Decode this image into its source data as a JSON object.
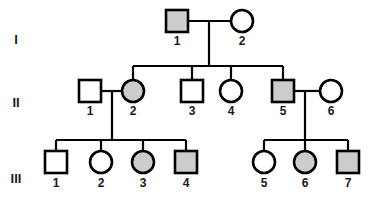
{
  "diagram": {
    "type": "pedigree-chart",
    "width": 381,
    "height": 201,
    "background_color": "#ffffff",
    "line_color": "#000000",
    "affected_fill": "#cccccc",
    "unaffected_fill": "#ffffff"
  },
  "generation_labels": [
    {
      "name": "generation-label-1",
      "text": "I",
      "x": 16,
      "y": 41
    },
    {
      "name": "generation-label-2",
      "text": "II",
      "x": 16,
      "y": 104
    },
    {
      "name": "generation-label-3",
      "text": "III",
      "x": 16,
      "y": 180
    }
  ],
  "individuals": [
    {
      "id": "I-1",
      "label": "1",
      "generation": "I",
      "sex": "male",
      "shape": "square",
      "affected": true,
      "cx": 177,
      "cy": 21,
      "label_x": 177,
      "label_y": 42
    },
    {
      "id": "I-2",
      "label": "2",
      "generation": "I",
      "sex": "female",
      "shape": "circle",
      "affected": false,
      "cx": 242,
      "cy": 21,
      "label_x": 242,
      "label_y": 42
    },
    {
      "id": "II-1",
      "label": "1",
      "generation": "II",
      "sex": "male",
      "shape": "square",
      "affected": false,
      "cx": 90,
      "cy": 91,
      "label_x": 90,
      "label_y": 112
    },
    {
      "id": "II-2",
      "label": "2",
      "generation": "II",
      "sex": "female",
      "shape": "circle",
      "affected": true,
      "cx": 133,
      "cy": 91,
      "label_x": 133,
      "label_y": 112
    },
    {
      "id": "II-3",
      "label": "3",
      "generation": "II",
      "sex": "male",
      "shape": "square",
      "affected": false,
      "cx": 192,
      "cy": 91,
      "label_x": 192,
      "label_y": 112
    },
    {
      "id": "II-4",
      "label": "4",
      "generation": "II",
      "sex": "female",
      "shape": "circle",
      "affected": false,
      "cx": 231,
      "cy": 91,
      "label_x": 231,
      "label_y": 112
    },
    {
      "id": "II-5",
      "label": "5",
      "generation": "II",
      "sex": "male",
      "shape": "square",
      "affected": true,
      "cx": 283,
      "cy": 91,
      "label_x": 283,
      "label_y": 112
    },
    {
      "id": "II-6",
      "label": "6",
      "generation": "II",
      "sex": "female",
      "shape": "circle",
      "affected": false,
      "cx": 331,
      "cy": 91,
      "label_x": 331,
      "label_y": 112
    },
    {
      "id": "III-1",
      "label": "1",
      "generation": "III",
      "sex": "male",
      "shape": "square",
      "affected": false,
      "cx": 56,
      "cy": 162,
      "label_x": 56,
      "label_y": 184
    },
    {
      "id": "III-2",
      "label": "2",
      "generation": "III",
      "sex": "female",
      "shape": "circle",
      "affected": false,
      "cx": 101,
      "cy": 162,
      "label_x": 101,
      "label_y": 184
    },
    {
      "id": "III-3",
      "label": "3",
      "generation": "III",
      "sex": "female",
      "shape": "circle",
      "affected": true,
      "cx": 143,
      "cy": 162,
      "label_x": 143,
      "label_y": 184
    },
    {
      "id": "III-4",
      "label": "4",
      "generation": "III",
      "sex": "male",
      "shape": "square",
      "affected": true,
      "cx": 186,
      "cy": 162,
      "label_x": 186,
      "label_y": 184
    },
    {
      "id": "III-5",
      "label": "5",
      "generation": "III",
      "sex": "female",
      "shape": "circle",
      "affected": false,
      "cx": 264,
      "cy": 162,
      "label_x": 264,
      "label_y": 184
    },
    {
      "id": "III-6",
      "label": "6",
      "generation": "III",
      "sex": "female",
      "shape": "circle",
      "affected": true,
      "cx": 305,
      "cy": 162,
      "label_x": 305,
      "label_y": 184
    },
    {
      "id": "III-7",
      "label": "7",
      "generation": "III",
      "sex": "male",
      "shape": "square",
      "affected": true,
      "cx": 348,
      "cy": 162,
      "label_x": 348,
      "label_y": 184
    }
  ],
  "symbol_size": {
    "square_side": 22,
    "circle_radius": 11
  },
  "connections": [
    {
      "name": "mating-line-I1-I2",
      "x1": 188,
      "y1": 21,
      "x2": 231,
      "y2": 21
    },
    {
      "name": "descent-line-I1-I2",
      "x1": 209,
      "y1": 21,
      "x2": 209,
      "y2": 66
    },
    {
      "name": "sibship-line-gen2",
      "x1": 133,
      "y1": 66,
      "x2": 283,
      "y2": 66
    },
    {
      "name": "drop-line-II2",
      "x1": 133,
      "y1": 66,
      "x2": 133,
      "y2": 80
    },
    {
      "name": "drop-line-II3",
      "x1": 192,
      "y1": 66,
      "x2": 192,
      "y2": 80
    },
    {
      "name": "drop-line-II4",
      "x1": 231,
      "y1": 66,
      "x2": 231,
      "y2": 80
    },
    {
      "name": "drop-line-II5",
      "x1": 283,
      "y1": 66,
      "x2": 283,
      "y2": 80
    },
    {
      "name": "mating-line-II1-II2",
      "x1": 101,
      "y1": 91,
      "x2": 122,
      "y2": 91
    },
    {
      "name": "descent-line-II1-II2",
      "x1": 112,
      "y1": 91,
      "x2": 112,
      "y2": 140
    },
    {
      "name": "sibship-line-gen3-left",
      "x1": 56,
      "y1": 140,
      "x2": 186,
      "y2": 140
    },
    {
      "name": "drop-line-III1",
      "x1": 56,
      "y1": 140,
      "x2": 56,
      "y2": 151
    },
    {
      "name": "drop-line-III2",
      "x1": 101,
      "y1": 140,
      "x2": 101,
      "y2": 151
    },
    {
      "name": "drop-line-III3",
      "x1": 143,
      "y1": 140,
      "x2": 143,
      "y2": 151
    },
    {
      "name": "drop-line-III4",
      "x1": 186,
      "y1": 140,
      "x2": 186,
      "y2": 151
    },
    {
      "name": "mating-line-II5-II6",
      "x1": 294,
      "y1": 91,
      "x2": 320,
      "y2": 91
    },
    {
      "name": "descent-line-II5-II6",
      "x1": 305,
      "y1": 91,
      "x2": 305,
      "y2": 140
    },
    {
      "name": "sibship-line-gen3-right",
      "x1": 264,
      "y1": 140,
      "x2": 348,
      "y2": 140
    },
    {
      "name": "drop-line-III5",
      "x1": 264,
      "y1": 140,
      "x2": 264,
      "y2": 151
    },
    {
      "name": "drop-line-III6",
      "x1": 305,
      "y1": 140,
      "x2": 305,
      "y2": 151
    },
    {
      "name": "drop-line-III7",
      "x1": 348,
      "y1": 140,
      "x2": 348,
      "y2": 151
    }
  ]
}
